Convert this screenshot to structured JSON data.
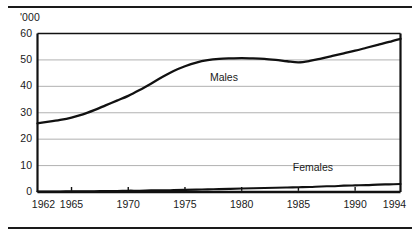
{
  "chart_data": {
    "type": "line",
    "title": "",
    "subtitle": "",
    "xlabel": "",
    "ylabel": "'000",
    "unit_label": "'000",
    "xlim": [
      1962,
      1994
    ],
    "ylim": [
      0,
      60
    ],
    "grid": true,
    "grid_axis": "y",
    "legend": "inline-annotations",
    "yticks": [
      0,
      10,
      20,
      30,
      40,
      50,
      60
    ],
    "ytick_labels": [
      "0",
      "10",
      "20",
      "30",
      "40",
      "50",
      "60"
    ],
    "xticks": [
      1962,
      1965,
      1970,
      1975,
      1980,
      1985,
      1990,
      1994
    ],
    "xtick_labels": [
      "1962",
      "1965",
      "1970",
      "1975",
      "1980",
      "1985",
      "1990",
      "1994"
    ],
    "x": [
      1962,
      1963,
      1964,
      1965,
      1966,
      1967,
      1968,
      1969,
      1970,
      1971,
      1972,
      1973,
      1974,
      1975,
      1976,
      1977,
      1978,
      1979,
      1980,
      1981,
      1982,
      1983,
      1984,
      1985,
      1986,
      1987,
      1988,
      1989,
      1990,
      1991,
      1992,
      1993,
      1994
    ],
    "series": [
      {
        "name": "Males",
        "label": "Males",
        "color": "#111111",
        "values": [
          26.0,
          26.6,
          27.3,
          28.2,
          29.4,
          31.0,
          32.8,
          34.6,
          36.4,
          38.6,
          41.0,
          43.5,
          45.8,
          47.6,
          49.0,
          49.9,
          50.4,
          50.6,
          50.7,
          50.6,
          50.4,
          50.0,
          49.5,
          49.1,
          49.6,
          50.5,
          51.5,
          52.5,
          53.5,
          54.6,
          55.7,
          56.8,
          58.0
        ]
      },
      {
        "name": "Females",
        "label": "Females",
        "color": "#111111",
        "values": [
          0.2,
          0.2,
          0.2,
          0.3,
          0.3,
          0.3,
          0.4,
          0.4,
          0.5,
          0.5,
          0.6,
          0.6,
          0.7,
          0.8,
          0.9,
          1.0,
          1.1,
          1.2,
          1.3,
          1.4,
          1.5,
          1.6,
          1.7,
          1.8,
          1.9,
          2.1,
          2.2,
          2.4,
          2.5,
          2.6,
          2.8,
          2.9,
          3.0
        ]
      }
    ],
    "annotations": [
      {
        "text": "Males",
        "x": 1977.2,
        "y": 43.0
      },
      {
        "text": "Females",
        "x": 1984.5,
        "y": 9.0
      }
    ],
    "colors": {
      "background": "#ffffff",
      "axis": "#111111",
      "gridline": "#a8a8a8",
      "text": "#1a1a1a",
      "series_line": "#111111"
    }
  }
}
